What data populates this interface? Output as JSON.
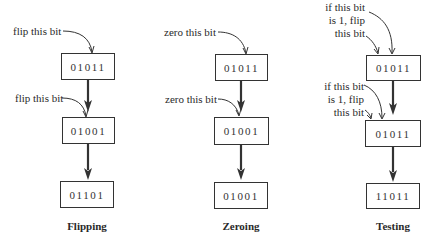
{
  "panels": [
    {
      "caption": "Flipping",
      "values": [
        "01011",
        "01001",
        "01101"
      ],
      "annotations": [
        "flip this bit",
        "flip this bit"
      ]
    },
    {
      "caption": "Zeroing",
      "values": [
        "01011",
        "01001",
        "01001"
      ],
      "annotations": [
        "zero this bit",
        "zero this bit"
      ]
    },
    {
      "caption": "Testing",
      "values": [
        "01011",
        "01011",
        "11011"
      ],
      "annotations": [
        [
          "if this bit",
          "is 1, flip",
          "this bit"
        ],
        [
          "if this bit",
          "is 1, flip",
          "this bit"
        ]
      ]
    }
  ],
  "colors": {
    "stroke": "#333333",
    "text": "#2a2a2a",
    "background": "#ffffff"
  }
}
